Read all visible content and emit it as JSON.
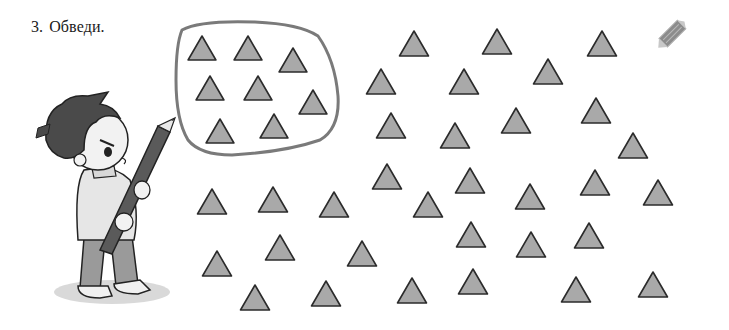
{
  "task": {
    "number": "3.",
    "instruction": "Обведи."
  },
  "colors": {
    "triangle_fill": "#a9a9a9",
    "triangle_stroke": "#2b2b2b",
    "blob_stroke": "#7a7a7a",
    "pencil_icon": "#8c8c8c"
  },
  "icons": {
    "corner": "pencil-icon",
    "illustration": "boy-with-pencil"
  },
  "circled_group": {
    "count": 8,
    "triangles": [
      {
        "cx": 202,
        "top": 36,
        "base": 60
      },
      {
        "cx": 248,
        "top": 36,
        "base": 60
      },
      {
        "cx": 293,
        "top": 48,
        "base": 72
      },
      {
        "cx": 210,
        "top": 76,
        "base": 100
      },
      {
        "cx": 258,
        "top": 76,
        "base": 100
      },
      {
        "cx": 313,
        "top": 90,
        "base": 114
      },
      {
        "cx": 220,
        "top": 119,
        "base": 143
      },
      {
        "cx": 274,
        "top": 114,
        "base": 138
      }
    ]
  },
  "loose_triangles": {
    "count": 36,
    "triangles": [
      {
        "cx": 414,
        "top": 31,
        "base": 56
      },
      {
        "cx": 497,
        "top": 29,
        "base": 54
      },
      {
        "cx": 602,
        "top": 31,
        "base": 56
      },
      {
        "cx": 381,
        "top": 69,
        "base": 94
      },
      {
        "cx": 464,
        "top": 69,
        "base": 94
      },
      {
        "cx": 548,
        "top": 59,
        "base": 84
      },
      {
        "cx": 391,
        "top": 113,
        "base": 138
      },
      {
        "cx": 455,
        "top": 123,
        "base": 148
      },
      {
        "cx": 516,
        "top": 108,
        "base": 133
      },
      {
        "cx": 596,
        "top": 98,
        "base": 123
      },
      {
        "cx": 633,
        "top": 133,
        "base": 158
      },
      {
        "cx": 387,
        "top": 164,
        "base": 189
      },
      {
        "cx": 470,
        "top": 168,
        "base": 193
      },
      {
        "cx": 530,
        "top": 184,
        "base": 209
      },
      {
        "cx": 595,
        "top": 170,
        "base": 195
      },
      {
        "cx": 658,
        "top": 180,
        "base": 205
      },
      {
        "cx": 428,
        "top": 192,
        "base": 217
      },
      {
        "cx": 212,
        "top": 189,
        "base": 214
      },
      {
        "cx": 273,
        "top": 187,
        "base": 212
      },
      {
        "cx": 334,
        "top": 192,
        "base": 217
      },
      {
        "cx": 471,
        "top": 222,
        "base": 247
      },
      {
        "cx": 531,
        "top": 232,
        "base": 257
      },
      {
        "cx": 589,
        "top": 223,
        "base": 248
      },
      {
        "cx": 280,
        "top": 235,
        "base": 260
      },
      {
        "cx": 362,
        "top": 241,
        "base": 266
      },
      {
        "cx": 217,
        "top": 251,
        "base": 276
      },
      {
        "cx": 255,
        "top": 285,
        "base": 310
      },
      {
        "cx": 326,
        "top": 281,
        "base": 306
      },
      {
        "cx": 412,
        "top": 278,
        "base": 303
      },
      {
        "cx": 473,
        "top": 269,
        "base": 294
      },
      {
        "cx": 576,
        "top": 277,
        "base": 302
      },
      {
        "cx": 653,
        "top": 272,
        "base": 297
      }
    ]
  }
}
